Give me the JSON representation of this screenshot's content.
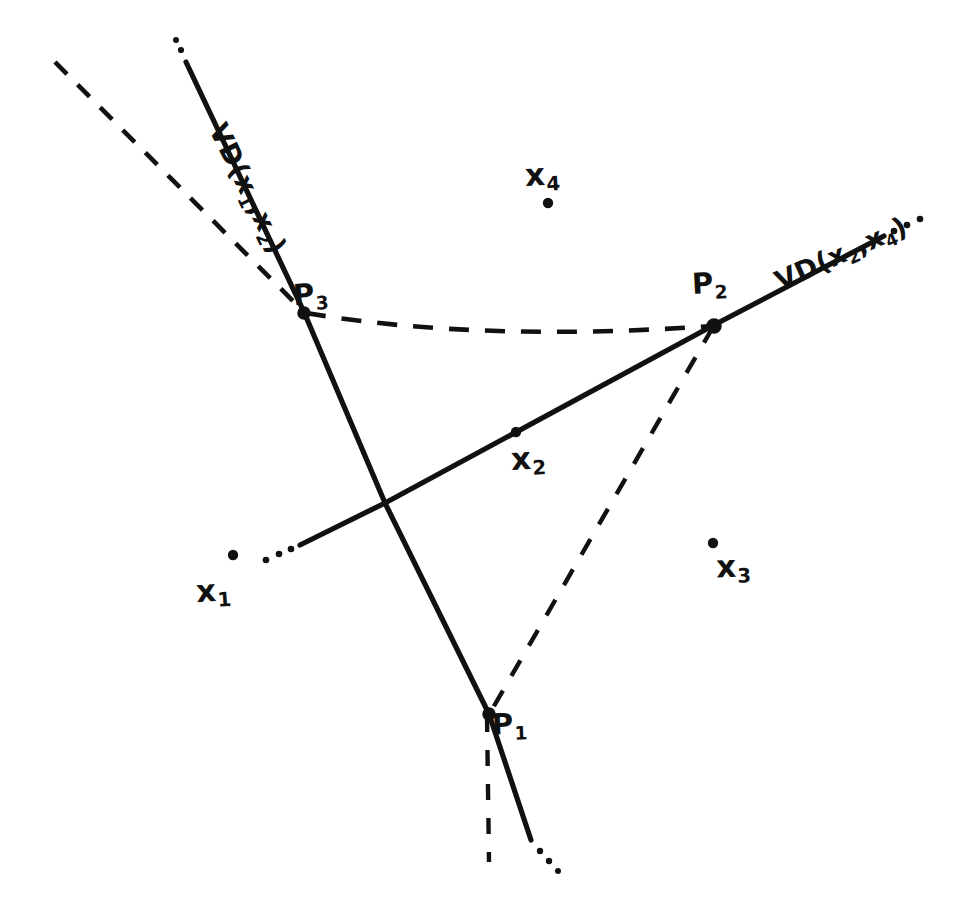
{
  "figure": {
    "ink_color": "#111111",
    "background_color": "#ffffff"
  },
  "sites": [
    {
      "id": "x1",
      "label": "x",
      "subscript": "1",
      "x": 222,
      "y": 556,
      "dot_x": 233,
      "dot_y": 555
    },
    {
      "id": "x2",
      "label": "x",
      "subscript": "2",
      "x": 529,
      "y": 461,
      "dot_x": 516,
      "dot_y": 432
    },
    {
      "id": "x3",
      "label": "x",
      "subscript": "3",
      "x": 733,
      "y": 566,
      "dot_x": 713,
      "dot_y": 543
    },
    {
      "id": "x4",
      "label": "x",
      "subscript": "4",
      "x": 547,
      "y": 177,
      "dot_x": 548,
      "dot_y": 203
    }
  ],
  "vertices": [
    {
      "id": "P1",
      "label": "P",
      "subscript": "1",
      "x": 489,
      "y": 714
    },
    {
      "id": "P2",
      "label": "P",
      "subscript": "2",
      "x": 714,
      "y": 325
    },
    {
      "id": "P3",
      "label": "P",
      "subscript": "3",
      "x": 304,
      "y": 312
    }
  ],
  "bisectors": [
    {
      "id": "vd12",
      "label": "VD(x",
      "label_full": "VD(x1,x2)",
      "sub_a": "1",
      "mid": ",x",
      "sub_b": "2",
      "close": ")",
      "style": "solid",
      "rotation_deg": 64
    },
    {
      "id": "vd24",
      "label": "VD(x",
      "label_full": "VD(x2,x4)",
      "sub_a": "2",
      "mid": ",x",
      "sub_b": "4",
      "close": ")",
      "style": "solid",
      "rotation_deg": -24
    }
  ],
  "strokes": {
    "solid_vd12": "M 186,62 L 304,312 L 385,503 L 489,714 L 531,840",
    "solid_vd24": "M 300,545 L 385,503 L 714,325 L 884,236",
    "dotted_vd12_top": "M 182,52 L 178,44",
    "dotted_vd12_bottom": "M 540,851 L 551,862",
    "dotted_vd24_left": "M 292,549 L 266,560",
    "dotted_vd24_right": "M 893,231 L 920,218",
    "dashed_upper_left": "M 55,62 L 304,312",
    "dashed_p3_to_p2": "M 306,313 C 430,334 570,336 713,326",
    "dashed_p2_to_p1": "M 713,327 L 490,713",
    "dashed_p1_down": "M 487,716 L 489,862"
  },
  "legend_note": ""
}
